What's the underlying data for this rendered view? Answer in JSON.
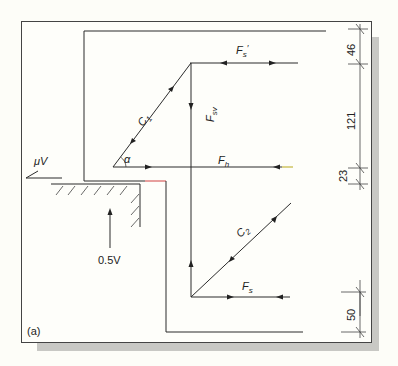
{
  "figure": {
    "panel_label": "(a)",
    "colors": {
      "background": "#fdfdf8",
      "line": "#2b2b2b",
      "shadow": "#c8c8c4",
      "accent_red": "#d04040",
      "accent_yellow": "#b8a818"
    }
  },
  "labels": {
    "friction_force": "μV",
    "support_reaction": "0.5V",
    "angle": "α",
    "strut_1": "C₁",
    "strut_2": "C₂",
    "top_tie": "F′s",
    "vertical_tie": "Fsv",
    "horizontal_tie": "Fh",
    "bottom_tie": "Fs"
  },
  "dimensions": {
    "segments": [
      "46",
      "121",
      "23",
      "50"
    ]
  }
}
